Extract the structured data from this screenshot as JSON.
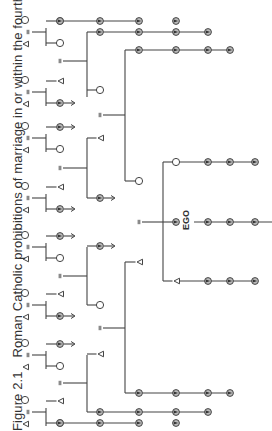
{
  "figure": {
    "number": "Figure 2.1",
    "caption": "Roman Catholic prohibitions of marriage in or within the fourth",
    "ego_label": "EGO",
    "colors": {
      "line": "#444444",
      "shade": "#777777",
      "background": "#ffffff"
    },
    "orientation": "rotated-90-ccw"
  },
  "legend_symbols": {
    "triangle": "male",
    "circle": "female",
    "shaded": "prohibited relative",
    "equals": "marriage",
    "arrow": "line continues"
  },
  "ancestor_couples": [
    {
      "id": "a1",
      "children": [
        {
          "sex": "m",
          "shaded": true,
          "line": true
        },
        {
          "sex": "f",
          "shaded": false
        }
      ]
    },
    {
      "id": "a2",
      "children": [
        {
          "sex": "m",
          "shaded": false
        },
        {
          "sex": "m",
          "shaded": true,
          "arrow": true
        }
      ]
    },
    {
      "id": "a3",
      "children": [
        {
          "sex": "m",
          "shaded": true,
          "arrow": true
        },
        {
          "sex": "f",
          "shaded": false
        }
      ]
    },
    {
      "id": "a4",
      "children": [
        {
          "sex": "m",
          "shaded": false
        },
        {
          "sex": "m",
          "shaded": true,
          "arrow": true
        }
      ]
    },
    {
      "id": "a5",
      "children": [
        {
          "sex": "m",
          "shaded": true,
          "arrow": true
        },
        {
          "sex": "f",
          "shaded": false
        }
      ]
    },
    {
      "id": "a6",
      "children": [
        {
          "sex": "m",
          "shaded": false
        },
        {
          "sex": "m",
          "shaded": true,
          "arrow": true
        }
      ]
    },
    {
      "id": "a7",
      "children": [
        {
          "sex": "m",
          "shaded": true,
          "arrow": true
        },
        {
          "sex": "f",
          "shaded": false
        }
      ]
    },
    {
      "id": "a8",
      "children": [
        {
          "sex": "m",
          "shaded": false
        },
        {
          "sex": "m",
          "shaded": true,
          "line": true
        }
      ]
    }
  ],
  "descendant_lines": [
    {
      "id": "d1",
      "count": 3
    },
    {
      "id": "d2",
      "count": 4
    },
    {
      "id": "d3",
      "count": 4
    },
    {
      "id": "ego-sister",
      "count": 3
    },
    {
      "id": "ego",
      "count": 3
    },
    {
      "id": "ego-brother",
      "count": 3
    },
    {
      "id": "d4",
      "count": 4
    },
    {
      "id": "d5",
      "count": 4
    },
    {
      "id": "d6",
      "count": 3
    }
  ]
}
